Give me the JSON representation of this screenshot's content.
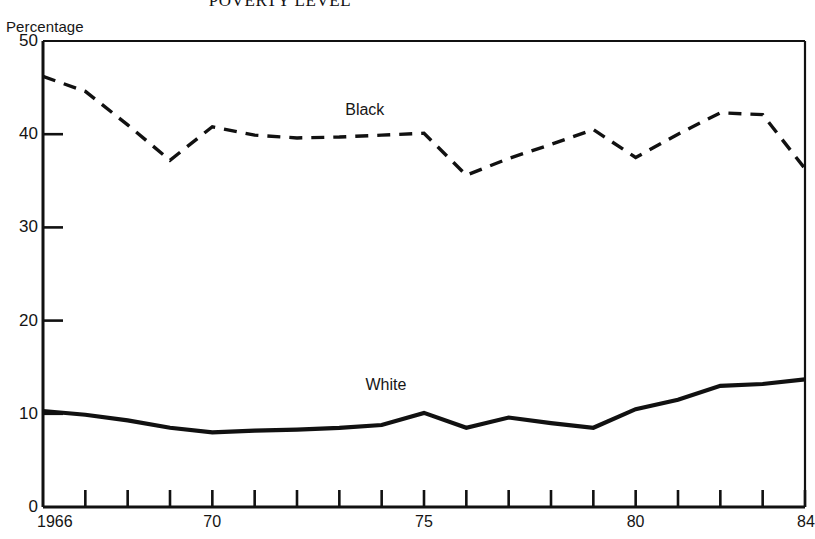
{
  "chart_data": {
    "type": "line",
    "title": "POVERTY LEVEL",
    "subtitle": "",
    "xlabel": "",
    "ylabel": "Percentage",
    "xlim": [
      1966,
      1984
    ],
    "ylim": [
      0,
      50
    ],
    "grid": false,
    "legend_position": "inline-annotation",
    "y_ticks": [
      0,
      10,
      20,
      30,
      40,
      50
    ],
    "y_tick_labels": [
      "0",
      "10",
      "20",
      "30",
      "40",
      "50"
    ],
    "x_ticks": [
      1966,
      1967,
      1968,
      1969,
      1970,
      1971,
      1972,
      1973,
      1974,
      1975,
      1976,
      1977,
      1978,
      1979,
      1980,
      1981,
      1982,
      1983,
      1984
    ],
    "x_tick_labels": [
      "1966",
      "70",
      "75",
      "80",
      "84"
    ],
    "x_labeled_years": [
      1966,
      1970,
      1975,
      1980,
      1984
    ],
    "x": [
      1966,
      1967,
      1968,
      1969,
      1970,
      1971,
      1972,
      1973,
      1974,
      1975,
      1976,
      1977,
      1978,
      1979,
      1980,
      1981,
      1982,
      1983,
      1984
    ],
    "series": [
      {
        "name": "Black",
        "style": "dashed",
        "color": "#111111",
        "values": [
          46.2,
          44.6,
          41.0,
          37.2,
          40.8,
          39.9,
          39.6,
          39.7,
          39.9,
          40.1,
          35.6,
          37.4,
          38.9,
          40.5,
          37.5,
          40.0,
          42.3,
          42.1,
          36.3
        ]
      },
      {
        "name": "White",
        "style": "solid",
        "color": "#111111",
        "values": [
          10.3,
          9.9,
          9.3,
          8.5,
          8.0,
          8.2,
          8.3,
          8.5,
          8.8,
          10.1,
          8.5,
          9.6,
          9.0,
          8.5,
          10.5,
          11.5,
          13.0,
          13.2,
          13.7
        ]
      }
    ],
    "annotations": [
      {
        "text": "Black",
        "x": 1973.6,
        "y": 42.6
      },
      {
        "text": "White",
        "x": 1974.1,
        "y": 13.1
      }
    ]
  },
  "axis": {
    "y_axis_name": "Percentage"
  }
}
